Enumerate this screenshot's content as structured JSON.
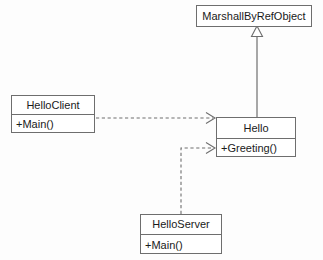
{
  "diagram": {
    "background_color": "#fdfdfd",
    "line_color": "#6e6e6e",
    "text_color": "#1a1a1a",
    "classes": [
      {
        "id": "marshall",
        "name": "MarshallByRefObject",
        "members": [],
        "x": 196,
        "y": 5,
        "width": 116,
        "height": 22
      },
      {
        "id": "helloclient",
        "name": "HelloClient",
        "members": [
          "+Main()"
        ],
        "x": 11,
        "y": 95,
        "width": 84,
        "height": 38
      },
      {
        "id": "hello",
        "name": "Hello",
        "members": [
          "+Greeting()"
        ],
        "x": 216,
        "y": 117,
        "width": 80,
        "height": 40
      },
      {
        "id": "helloserver",
        "name": "HelloServer",
        "members": [
          "+Main()"
        ],
        "x": 140,
        "y": 214,
        "width": 82,
        "height": 40
      }
    ],
    "relationships": [
      {
        "id": "inheritance-hello-marshall",
        "type": "generalization",
        "style": "solid",
        "arrowhead": "hollow-triangle",
        "from": "hello",
        "to": "marshall"
      },
      {
        "id": "dependency-helloclient-hello",
        "type": "dependency",
        "style": "dashed",
        "arrowhead": "open",
        "from": "helloclient",
        "to": "hello"
      },
      {
        "id": "dependency-helloserver-hello",
        "type": "dependency",
        "style": "dashed",
        "arrowhead": "open",
        "from": "helloserver",
        "to": "hello"
      }
    ]
  }
}
